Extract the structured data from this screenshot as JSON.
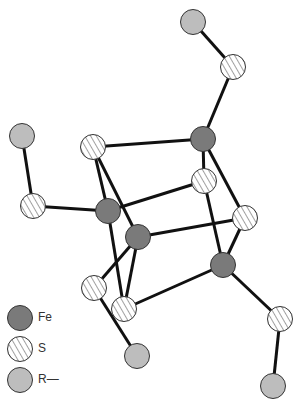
{
  "diagram": {
    "type": "molecular-structure",
    "colors": {
      "Fe": "#7a7a7a",
      "S": "#ffffff",
      "R": "#bdbdbd",
      "bond": "#111111"
    },
    "atoms": [
      {
        "id": "R1",
        "type": "R",
        "x": 193,
        "y": 22
      },
      {
        "id": "S1",
        "type": "S",
        "x": 233,
        "y": 67
      },
      {
        "id": "R2",
        "type": "R",
        "x": 22,
        "y": 136
      },
      {
        "id": "S2",
        "type": "S",
        "x": 33,
        "y": 206
      },
      {
        "id": "Fe1",
        "type": "Fe",
        "x": 203,
        "y": 139
      },
      {
        "id": "S3",
        "type": "S",
        "x": 93,
        "y": 147
      },
      {
        "id": "S4",
        "type": "S",
        "x": 204,
        "y": 181
      },
      {
        "id": "Fe2",
        "type": "Fe",
        "x": 108,
        "y": 211
      },
      {
        "id": "S5",
        "type": "S",
        "x": 245,
        "y": 218
      },
      {
        "id": "Fe3",
        "type": "Fe",
        "x": 138,
        "y": 237
      },
      {
        "id": "Fe4",
        "type": "Fe",
        "x": 223,
        "y": 265
      },
      {
        "id": "S6",
        "type": "S",
        "x": 94,
        "y": 288
      },
      {
        "id": "S7",
        "type": "S",
        "x": 124,
        "y": 309
      },
      {
        "id": "S8",
        "type": "S",
        "x": 280,
        "y": 319
      },
      {
        "id": "R3",
        "type": "R",
        "x": 137,
        "y": 356
      },
      {
        "id": "R4",
        "type": "R",
        "x": 273,
        "y": 386
      }
    ],
    "bonds": [
      [
        "R1",
        "S1"
      ],
      [
        "S1",
        "Fe1"
      ],
      [
        "R2",
        "S2"
      ],
      [
        "S2",
        "Fe2"
      ],
      [
        "Fe1",
        "S3"
      ],
      [
        "Fe1",
        "S4"
      ],
      [
        "Fe1",
        "S5"
      ],
      [
        "S3",
        "Fe2"
      ],
      [
        "S3",
        "Fe3"
      ],
      [
        "Fe2",
        "S4"
      ],
      [
        "Fe2",
        "S7"
      ],
      [
        "Fe3",
        "S5"
      ],
      [
        "Fe3",
        "S6"
      ],
      [
        "Fe3",
        "S7"
      ],
      [
        "S4",
        "Fe4"
      ],
      [
        "S5",
        "Fe4"
      ],
      [
        "Fe4",
        "S7"
      ],
      [
        "Fe4",
        "S8"
      ],
      [
        "S8",
        "R4"
      ],
      [
        "S6",
        "R3"
      ]
    ]
  },
  "legend": {
    "items": [
      {
        "type": "Fe",
        "label": "Fe"
      },
      {
        "type": "S",
        "label": "S"
      },
      {
        "type": "R",
        "label": "R—"
      }
    ]
  }
}
